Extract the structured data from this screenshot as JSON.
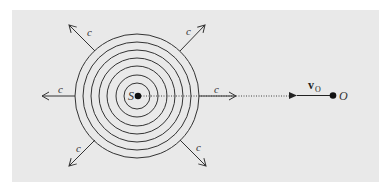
{
  "figure": {
    "background_color": "#e9e9e9",
    "line_color": "#333333",
    "source": {
      "label": "S",
      "center": [
        137,
        96
      ],
      "circle_radii": [
        62,
        54,
        46,
        38,
        30,
        21,
        13
      ]
    },
    "observer": {
      "label": "O",
      "position": [
        333,
        95
      ],
      "velocity_label": "v",
      "velocity_subscript": "O"
    },
    "wave_speed_label": "c",
    "arrows": [
      {
        "direction": "left",
        "label": "c"
      },
      {
        "direction": "right",
        "label": "c"
      },
      {
        "direction": "up-left",
        "label": "c"
      },
      {
        "direction": "up-right",
        "label": "c"
      },
      {
        "direction": "down-left",
        "label": "c"
      },
      {
        "direction": "down-right",
        "label": "c"
      }
    ]
  }
}
